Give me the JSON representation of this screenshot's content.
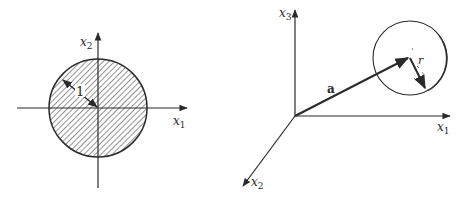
{
  "left_figure": {
    "axis_labels": {
      "horizontal": "x",
      "horizontal_sub": "1",
      "vertical": "x",
      "vertical_sub": "2"
    },
    "radius_label": "1",
    "disk": {
      "center": [
        98,
        108
      ],
      "radius": 49,
      "fill": "hatched"
    }
  },
  "right_figure": {
    "axis_labels": {
      "x1": "x",
      "x1_sub": "1",
      "x2": "x",
      "x2_sub": "2",
      "x3": "x",
      "x3_sub": "3"
    },
    "vector_label": "a",
    "radius_label": "r",
    "sphere": {
      "center": [
        410,
        58
      ],
      "radius": 37
    }
  },
  "colors": {
    "ink": "#2a2a2a",
    "background": "#ffffff"
  }
}
